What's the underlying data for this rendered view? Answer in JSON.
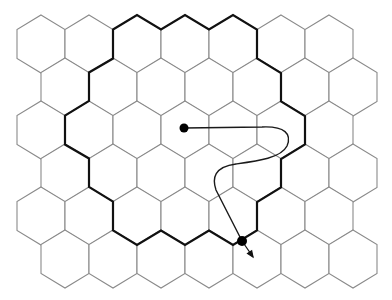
{
  "diagram": {
    "type": "hexagonal-grid",
    "grid": {
      "rows": 6,
      "cols": 7,
      "orientation": "pointy-top",
      "side": 29,
      "apothem": 24,
      "row_centers_y": [
        44,
        87,
        130,
        173,
        216,
        259
      ],
      "even_row_x0": 41,
      "odd_row_x0": 65,
      "col_spacing": 48
    },
    "colors": {
      "cell_stroke": "#8a8a8a",
      "boundary_stroke": "#111111",
      "curve_stroke": "#1a1a1a",
      "dot_fill": "#000000",
      "background": "#ffffff"
    },
    "boundary": {
      "description": "thick closed outline enclosing the central cluster of hexagons",
      "points": "113,29.5 137,15 161,29.5 185,15 209,29.5 233,15 257,29.5 257,58.5 281,73 281,101.5 305,116 305,144.5 281,159 281,187.5 257,202 257,230.5 233,245 209,230.5 185,245 161,230.5 137,245 113,230.5 113,201.5 89,187 89,158.5 65,144.5 65,115.5 89,101 89,72.5 113,58.5"
    },
    "curve": {
      "description": "path from interior start point looping right then down to boundary exit",
      "d": "M184,128 L262,127 C285,126 292,134 287,146 C281,158 258,161 236,164 C214,167 212,178 216,190 L242,241",
      "start_point": [
        184,
        128
      ],
      "end_point": [
        242,
        241
      ]
    },
    "arrow": {
      "from": [
        242,
        241
      ],
      "to": [
        253,
        257
      ]
    }
  }
}
